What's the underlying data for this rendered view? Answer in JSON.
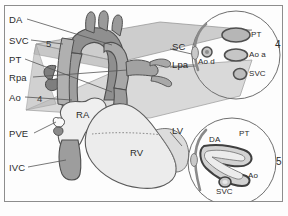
{
  "figure": {
    "border_color": "#8d8d8d",
    "background": "#fdfdfd"
  },
  "colors": {
    "outline": "#4a4a4a",
    "vessel_dark": "#8a8a8a",
    "vessel_mid": "#a6a6a6",
    "vessel_light": "#c2c2c2",
    "chamber_light": "#ededed",
    "chamber_shadow": "#d8d8d8",
    "plane_fill": "#b9b9b9",
    "plane_fill_2": "#cccccc",
    "leader": "#555555",
    "text": "#2b2b2b"
  },
  "left_labels": [
    {
      "id": "da",
      "text": "DA",
      "x": 9,
      "y": 15
    },
    {
      "id": "svc",
      "text": "SVC",
      "x": 9,
      "y": 36
    },
    {
      "id": "pt",
      "text": "PT",
      "x": 9,
      "y": 55
    },
    {
      "id": "rpa",
      "text": "Rpa",
      "x": 9,
      "y": 73
    },
    {
      "id": "ao",
      "text": "Ao",
      "x": 9,
      "y": 93
    },
    {
      "id": "pve",
      "text": "PVE",
      "x": 9,
      "y": 129
    },
    {
      "id": "ivc",
      "text": "IVC",
      "x": 9,
      "y": 163
    }
  ],
  "middle_labels": [
    {
      "id": "sc",
      "text": "SC",
      "x": 172,
      "y": 46
    },
    {
      "id": "lpa",
      "text": "Lpa",
      "x": 172,
      "y": 64
    },
    {
      "id": "lv",
      "text": "LV",
      "x": 172,
      "y": 129
    }
  ],
  "chamber_labels": [
    {
      "id": "ra",
      "text": "RA",
      "x": 79,
      "y": 115
    },
    {
      "id": "rv",
      "text": "RV",
      "x": 133,
      "y": 152
    }
  ],
  "plane_numbers": [
    {
      "id": "plane-5",
      "text": "5",
      "x": 46,
      "y": 43
    },
    {
      "id": "plane-4",
      "text": "4",
      "x": 37,
      "y": 98
    }
  ],
  "cross_sections": [
    {
      "id": "section-4",
      "number": "4",
      "number_x": 276,
      "number_y": 44,
      "cx": 236,
      "cy": 55,
      "r": 44,
      "structures": [
        {
          "id": "pt",
          "label": "PT",
          "label_x": 254,
          "label_y": 34,
          "shape": "ellipse-large"
        },
        {
          "id": "ao-a",
          "label": "Ao a",
          "label_x": 254,
          "label_y": 54,
          "shape": "ellipse-med"
        },
        {
          "id": "svc",
          "label": "SVC",
          "label_x": 249,
          "label_y": 73,
          "shape": "circle-small"
        },
        {
          "id": "ao-d",
          "label": "Ao d",
          "label_x": 202,
          "label_y": 60,
          "shape": "circle-tiny"
        }
      ]
    },
    {
      "id": "section-5",
      "number": "5",
      "number_x": 278,
      "number_y": 162,
      "cx": 232,
      "cy": 162,
      "r": 44,
      "structures": [
        {
          "id": "da",
          "label": "DA",
          "label_x": 213,
          "label_y": 145
        },
        {
          "id": "pt",
          "label": "PT",
          "label_x": 243,
          "label_y": 139
        },
        {
          "id": "ao",
          "label": "Ao",
          "label_x": 252,
          "label_y": 178
        },
        {
          "id": "svc",
          "label": "SVC",
          "label_x": 226,
          "label_y": 192
        }
      ]
    }
  ]
}
